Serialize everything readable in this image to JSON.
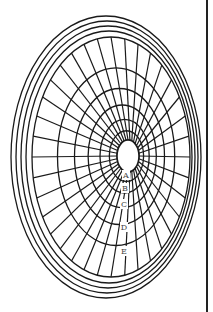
{
  "figure": {
    "type": "perspective-concentric-target-diagram",
    "ring_labels": [
      "A",
      "B",
      "C",
      "D",
      "E"
    ],
    "colors": {
      "line": "#1a1a1a",
      "background": "#ffffff",
      "label": "#444444"
    },
    "spoke_count": 36,
    "outer_bands": 4
  }
}
